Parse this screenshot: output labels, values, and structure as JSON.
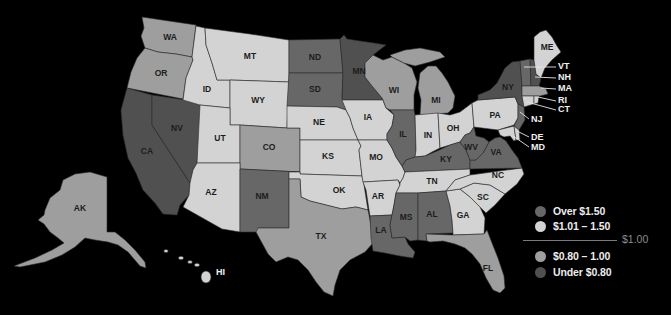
{
  "map": {
    "background": "#000000",
    "states": {
      "WA": {
        "label": "WA",
        "category": "080_100"
      },
      "OR": {
        "label": "OR",
        "category": "080_100"
      },
      "CA": {
        "label": "CA",
        "category": "under_080"
      },
      "NV": {
        "label": "NV",
        "category": "under_080"
      },
      "ID": {
        "label": "ID",
        "category": "101_150"
      },
      "MT": {
        "label": "MT",
        "category": "101_150"
      },
      "WY": {
        "label": "WY",
        "category": "101_150"
      },
      "UT": {
        "label": "UT",
        "category": "101_150"
      },
      "AZ": {
        "label": "AZ",
        "category": "101_150"
      },
      "CO": {
        "label": "CO",
        "category": "080_100"
      },
      "NM": {
        "label": "NM",
        "category": "over_150"
      },
      "ND": {
        "label": "ND",
        "category": "over_150"
      },
      "SD": {
        "label": "SD",
        "category": "over_150"
      },
      "NE": {
        "label": "NE",
        "category": "101_150"
      },
      "KS": {
        "label": "KS",
        "category": "101_150"
      },
      "OK": {
        "label": "OK",
        "category": "101_150"
      },
      "TX": {
        "label": "TX",
        "category": "080_100"
      },
      "MN": {
        "label": "MN",
        "category": "under_080"
      },
      "IA": {
        "label": "IA",
        "category": "101_150"
      },
      "MO": {
        "label": "MO",
        "category": "101_150"
      },
      "AR": {
        "label": "AR",
        "category": "101_150"
      },
      "LA": {
        "label": "LA",
        "category": "over_150"
      },
      "WI": {
        "label": "WI",
        "category": "080_100"
      },
      "MI": {
        "label": "MI",
        "category": "080_100"
      },
      "IL": {
        "label": "IL",
        "category": "over_150"
      },
      "IN": {
        "label": "IN",
        "category": "101_150"
      },
      "OH": {
        "label": "OH",
        "category": "101_150"
      },
      "KY": {
        "label": "KY",
        "category": "over_150"
      },
      "TN": {
        "label": "TN",
        "category": "101_150"
      },
      "MS": {
        "label": "MS",
        "category": "over_150"
      },
      "AL": {
        "label": "AL",
        "category": "over_150"
      },
      "GA": {
        "label": "GA",
        "category": "101_150"
      },
      "FL": {
        "label": "FL",
        "category": "080_100"
      },
      "SC": {
        "label": "SC",
        "category": "101_150"
      },
      "NC": {
        "label": "NC",
        "category": "101_150"
      },
      "VA": {
        "label": "VA",
        "category": "over_150"
      },
      "WV": {
        "label": "WV",
        "category": "over_150"
      },
      "PA": {
        "label": "PA",
        "category": "101_150"
      },
      "NY": {
        "label": "NY",
        "category": "under_080"
      },
      "NJ": {
        "label": "NJ",
        "category": "over_150"
      },
      "DE": {
        "label": "DE",
        "category": "101_150"
      },
      "MD": {
        "label": "MD",
        "category": "101_150"
      },
      "VT": {
        "label": "VT",
        "category": "over_150"
      },
      "NH": {
        "label": "NH",
        "category": "under_080"
      },
      "ME": {
        "label": "ME",
        "category": "101_150"
      },
      "MA": {
        "label": "MA",
        "category": "080_100"
      },
      "RI": {
        "label": "RI",
        "category": "101_150"
      },
      "CT": {
        "label": "CT",
        "category": "101_150"
      },
      "AK": {
        "label": "AK",
        "category": "080_100"
      },
      "HI": {
        "label": "HI",
        "category": "101_150"
      }
    }
  },
  "legend": {
    "items": [
      {
        "key": "over_150",
        "label": "Over $1.50",
        "color": "#676767"
      },
      {
        "key": "101_150",
        "label": "$1.01 – 1.50",
        "color": "#d3d3d3"
      },
      {
        "key": "080_100",
        "label": "$0.80 – 1.00",
        "color": "#9e9e9e"
      },
      {
        "key": "under_080",
        "label": "Under $0.80",
        "color": "#505050"
      }
    ],
    "threshold_label": "$1.00"
  }
}
